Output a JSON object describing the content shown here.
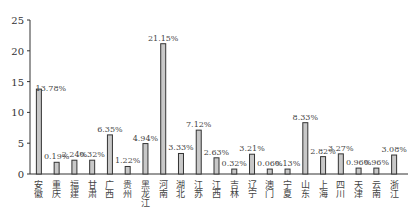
{
  "chart_data": {
    "type": "bar",
    "title": "",
    "xlabel": "",
    "ylabel": "",
    "ylim": [
      0,
      25
    ],
    "yticks": [
      0,
      5,
      10,
      15,
      20,
      25
    ],
    "grid": false,
    "legend": null,
    "categories": [
      "安徽",
      "重庆",
      "福建",
      "甘肃",
      "广西",
      "贵州",
      "黑龙江",
      "河南",
      "湖北",
      "江苏",
      "江西",
      "吉林",
      "辽宁",
      "澳门",
      "宁夏",
      "山东",
      "上海",
      "四川",
      "天津",
      "云南",
      "浙江"
    ],
    "values": [
      13.78,
      0.19,
      2.24,
      0.32,
      6.35,
      1.22,
      4.94,
      21.15,
      3.33,
      7.12,
      2.63,
      0.32,
      3.21,
      0.06,
      0.13,
      8.33,
      2.82,
      3.27,
      0.96,
      0.96,
      3.08
    ],
    "bar_heights": [
      13.78,
      1.9,
      2.24,
      2.24,
      6.35,
      1.22,
      4.94,
      21.15,
      3.33,
      7.12,
      2.63,
      0.8,
      3.21,
      0.8,
      0.8,
      8.33,
      2.82,
      3.27,
      0.96,
      0.96,
      3.08
    ],
    "labels": [
      "13.78%",
      "0.19%",
      "2.24%",
      "0.32%",
      "6.35%",
      "1.22%",
      "4.94%",
      "21.15%",
      "3.33%",
      "7.12%",
      "2.63%",
      "0.32%",
      "3.21%",
      "0.06%",
      "0.13%",
      "8.33%",
      "2.82%",
      "3.27%",
      "0.96%",
      "0.96%",
      "3.08%"
    ],
    "colors": {
      "bar_fill": "#c8c8c8",
      "bar_stroke": "#333333",
      "axis": "#333333"
    }
  }
}
